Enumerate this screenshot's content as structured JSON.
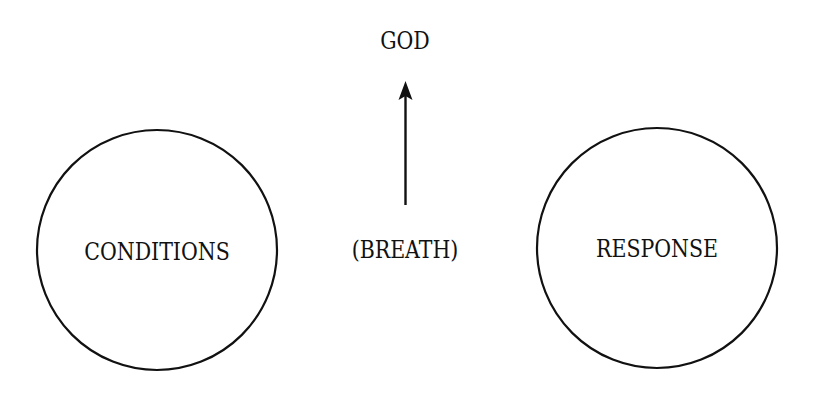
{
  "diagram": {
    "top_label": "GOD",
    "center_label": "(BREATH)",
    "left_circle_label": "CONDITIONS",
    "right_circle_label": "RESPONSE",
    "arrow": {
      "from": "(BREATH)",
      "to": "GOD",
      "direction": "up"
    },
    "colors": {
      "stroke": "#111111",
      "background": "#ffffff"
    }
  }
}
